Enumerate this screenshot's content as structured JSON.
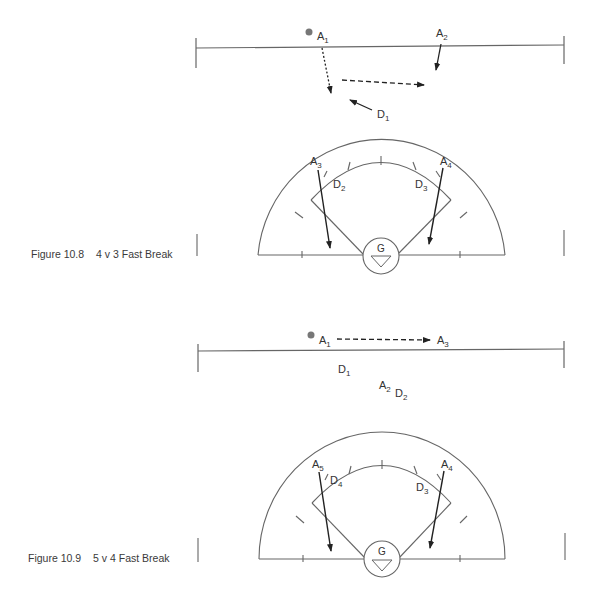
{
  "figures": [
    {
      "number": "Figure 10.8",
      "title": "4 v 3 Fast Break",
      "labels": {
        "A1": {
          "base": "A",
          "sub": "1"
        },
        "A2": {
          "base": "A",
          "sub": "2"
        },
        "A3": {
          "base": "A",
          "sub": "3"
        },
        "A4": {
          "base": "A",
          "sub": "4"
        },
        "D1": {
          "base": "D",
          "sub": "1"
        },
        "D2": {
          "base": "D",
          "sub": "2"
        },
        "D3": {
          "base": "D",
          "sub": "3"
        },
        "G": "G"
      }
    },
    {
      "number": "Figure 10.9",
      "title": "5 v 4 Fast Break",
      "labels": {
        "A1": {
          "base": "A",
          "sub": "1"
        },
        "A2": {
          "base": "A",
          "sub": "2"
        },
        "A3": {
          "base": "A",
          "sub": "3"
        },
        "A4": {
          "base": "A",
          "sub": "4"
        },
        "A5": {
          "base": "A",
          "sub": "5"
        },
        "D1": {
          "base": "D",
          "sub": "1"
        },
        "D2": {
          "base": "D",
          "sub": "2"
        },
        "D3": {
          "base": "D",
          "sub": "3"
        },
        "D4": {
          "base": "D",
          "sub": "4"
        },
        "G": "G"
      }
    }
  ],
  "colors": {
    "line": "#555555",
    "arrow": "#222222",
    "ball": "#777777",
    "text": "#333333"
  }
}
